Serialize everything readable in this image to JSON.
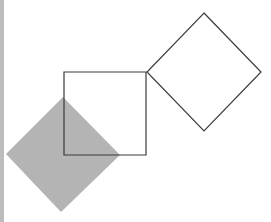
{
  "figure": {
    "background": "#ffffff",
    "edge_strip_color": "#bdbdbd",
    "shapes": [
      {
        "id": "filled-diamond",
        "kind": "diamond",
        "fill": "#b4b4b4",
        "stroke": "none",
        "points": "63,97 120,155 61,212 6,154"
      },
      {
        "id": "center-square",
        "kind": "square",
        "fill": "none",
        "stroke": "#3a3a3a",
        "points": "64,72 146,72 146,155 64,155"
      },
      {
        "id": "outline-diamond",
        "kind": "diamond",
        "fill": "none",
        "stroke": "#3a3a3a",
        "points": "204,13 261,72 204,131 147,72"
      }
    ]
  }
}
